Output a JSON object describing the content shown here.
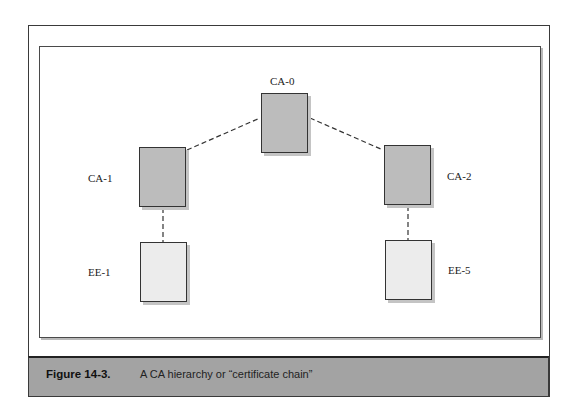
{
  "diagram": {
    "title": "CA hierarchy",
    "nodes": [
      {
        "id": "CA-0",
        "label": "CA-0",
        "type": "ca"
      },
      {
        "id": "CA-1",
        "label": "CA-1",
        "type": "ca"
      },
      {
        "id": "CA-2",
        "label": "CA-2",
        "type": "ca"
      },
      {
        "id": "EE-1",
        "label": "EE-1",
        "type": "ee"
      },
      {
        "id": "EE-5",
        "label": "EE-5",
        "type": "ee"
      }
    ],
    "edges": [
      {
        "from": "CA-0",
        "to": "CA-1",
        "style": "dashed"
      },
      {
        "from": "CA-0",
        "to": "CA-2",
        "style": "dashed"
      },
      {
        "from": "CA-1",
        "to": "EE-1",
        "style": "dashed"
      },
      {
        "from": "CA-2",
        "to": "EE-5",
        "style": "dashed"
      }
    ],
    "colors": {
      "ca_fill": "#bcbcbc",
      "ee_fill": "#ececec",
      "caption_bar": "#a3a3a3"
    }
  },
  "caption": {
    "figure_number": "Figure 14-3.",
    "text": "A CA hierarchy or “certificate chain”"
  }
}
